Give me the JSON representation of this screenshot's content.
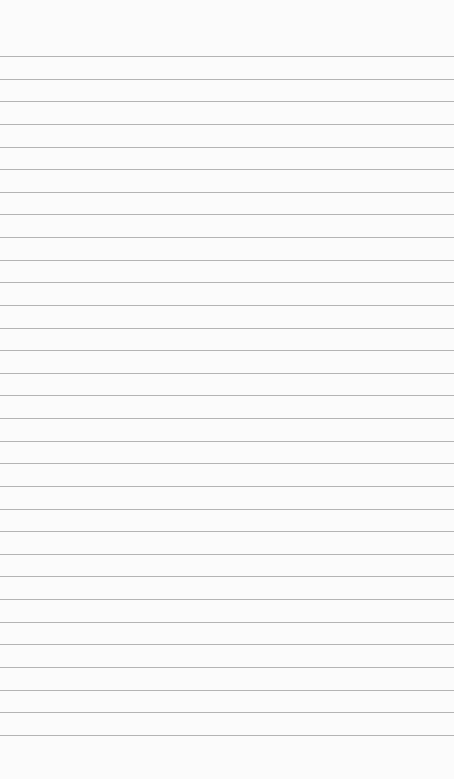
{
  "page": {
    "type": "lined-paper",
    "background_color": "#fbfbfb",
    "line_color": "#b4b4b4",
    "line_count": 31,
    "first_line_y": 56,
    "line_spacing": 22.63
  }
}
